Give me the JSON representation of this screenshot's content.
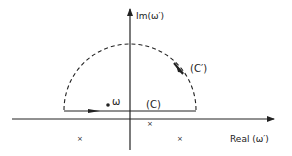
{
  "diagram": {
    "type": "complex-plane-contour",
    "axes": {
      "imag_label": "Im(ω′)",
      "real_label": "Real (ω′)"
    },
    "contours": [
      {
        "id": "C",
        "label": "(C)",
        "style": "solid",
        "shape": "line segment along real direction, above real axis, arrow pointing right"
      },
      {
        "id": "C_prime",
        "label": "(C′)",
        "style": "dashed",
        "shape": "semicircle in upper half-plane, arrow clockwise"
      }
    ],
    "points": [
      {
        "label": "ω",
        "marker": "dot"
      }
    ],
    "poles": [
      {
        "marker": "×",
        "position": "lower-left"
      },
      {
        "marker": "×",
        "position": "just below real axis, right of origin"
      },
      {
        "marker": "×",
        "position": "lower-right"
      }
    ],
    "colors": {
      "ink": "#222222",
      "background": "#ffffff"
    }
  }
}
